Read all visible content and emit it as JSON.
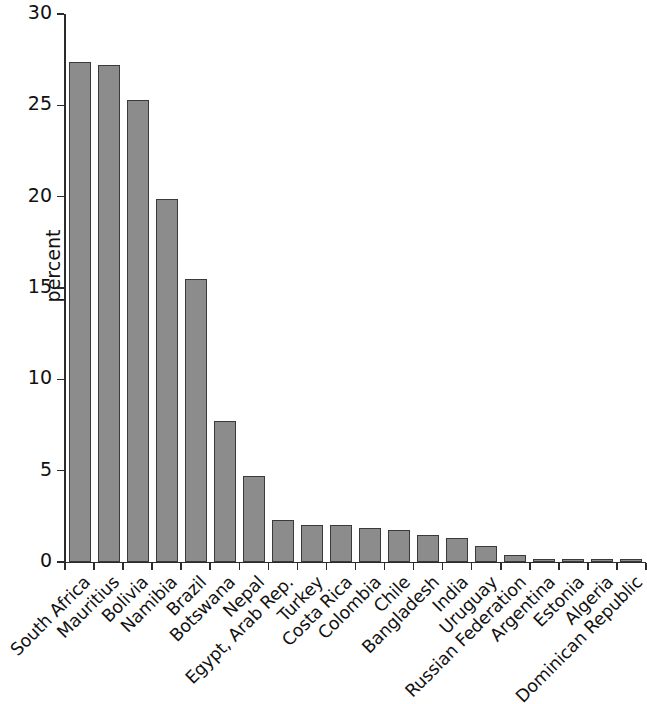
{
  "chart_data": {
    "type": "bar",
    "title": "",
    "xlabel": "",
    "ylabel": "percent",
    "ylim": [
      0,
      30
    ],
    "yticks": [
      0,
      5,
      10,
      15,
      20,
      25,
      30
    ],
    "ytick_labels": [
      "0",
      "5",
      "10",
      "15",
      "20",
      "25",
      "30"
    ],
    "grid": false,
    "legend": null,
    "bar_color": "#8c8c8c",
    "bar_edge_color": "#3a3a3a",
    "axis_color": "#2b2b2b",
    "categories": [
      "South Africa",
      "Mauritius",
      "Bolivia",
      "Namibia",
      "Brazil",
      "Botswana",
      "Nepal",
      "Egypt, Arab Rep.",
      "Turkey",
      "Costa Rica",
      "Colombia",
      "Chile",
      "Bangladesh",
      "India",
      "Uruguay",
      "Russian Federation",
      "Argentina",
      "Estonia",
      "Algeria",
      "Dominican Republic"
    ],
    "values": [
      27.4,
      27.2,
      25.3,
      19.9,
      15.5,
      7.7,
      4.7,
      2.3,
      2.05,
      2.0,
      1.85,
      1.75,
      1.5,
      1.3,
      0.85,
      0.4,
      0.15,
      0.1,
      0.12,
      0.1
    ]
  }
}
